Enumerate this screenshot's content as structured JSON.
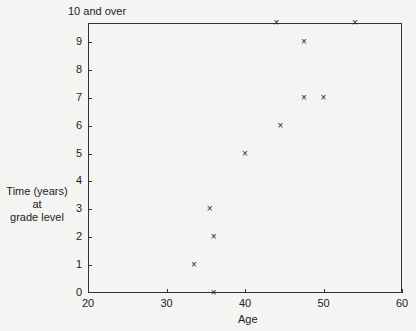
{
  "chart_data": {
    "type": "scatter",
    "title": "",
    "xlabel": "Age",
    "ylabel": "Time (years) at grade level",
    "xlim": [
      20,
      60
    ],
    "ylim": [
      0,
      10
    ],
    "x_ticks": [
      "20",
      "30",
      "40",
      "50",
      "60"
    ],
    "y_ticks": [
      "0",
      "1",
      "2",
      "3",
      "4",
      "5",
      "6",
      "7",
      "8",
      "9"
    ],
    "y_top_label": "10 and over",
    "grid": false,
    "marker": "x",
    "points": [
      {
        "x": 33.5,
        "y": 1
      },
      {
        "x": 35.5,
        "y": 3
      },
      {
        "x": 36,
        "y": 2
      },
      {
        "x": 36,
        "y": 0
      },
      {
        "x": 40,
        "y": 5
      },
      {
        "x": 44.5,
        "y": 6
      },
      {
        "x": 44,
        "y": 10
      },
      {
        "x": 47.5,
        "y": 9
      },
      {
        "x": 47.5,
        "y": 7
      },
      {
        "x": 50,
        "y": 7
      },
      {
        "x": 54,
        "y": 10
      }
    ]
  },
  "labels": {
    "ylabel_line1": "Time (years)",
    "ylabel_line2": "at",
    "ylabel_line3": "grade level",
    "xlabel": "Age",
    "top": "10 and over",
    "marker": "×"
  }
}
